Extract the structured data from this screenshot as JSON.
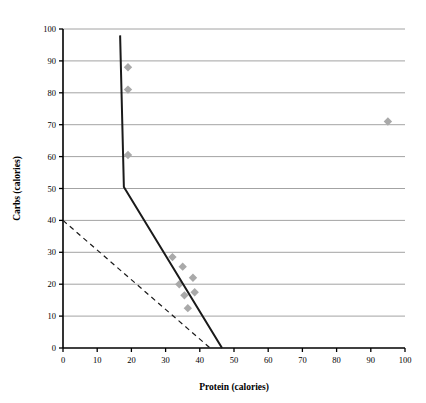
{
  "chart_data": {
    "type": "scatter",
    "title": "",
    "xlabel": "Protein (calories)",
    "ylabel": "Carbs (calories)",
    "xlim": [
      0,
      100
    ],
    "ylim": [
      0,
      100
    ],
    "xticks": [
      0,
      10,
      20,
      30,
      40,
      50,
      60,
      70,
      80,
      90,
      100
    ],
    "yticks": [
      0,
      10,
      20,
      30,
      40,
      50,
      60,
      70,
      80,
      90,
      100
    ],
    "xtick_labels": [
      "0",
      "10",
      "20",
      "30",
      "40",
      "50",
      "60",
      "70",
      "80",
      "90",
      "100"
    ],
    "ytick_labels": [
      "0",
      "10",
      "20",
      "30",
      "40",
      "50",
      "60",
      "70",
      "80",
      "90",
      "100"
    ],
    "grid": "horizontal",
    "legend": "none",
    "colors": {
      "marker": "#a9a9a9",
      "solid_line": "#1a1a1a",
      "dashed_line": "#1a1a1a",
      "gridline": "#8c8c8c",
      "axis": "#000000",
      "background": "#ffffff"
    },
    "series": [
      {
        "name": "observations",
        "type": "scatter",
        "marker": "diamond",
        "marker_color": "#a9a9a9",
        "points": [
          {
            "x": 19,
            "y": 88
          },
          {
            "x": 19,
            "y": 81
          },
          {
            "x": 19,
            "y": 60.5
          },
          {
            "x": 32,
            "y": 28.5
          },
          {
            "x": 35,
            "y": 25.5
          },
          {
            "x": 38,
            "y": 22
          },
          {
            "x": 34,
            "y": 20
          },
          {
            "x": 35.5,
            "y": 16.5
          },
          {
            "x": 38.5,
            "y": 17.5
          },
          {
            "x": 36.5,
            "y": 12.5
          },
          {
            "x": 95,
            "y": 71
          }
        ]
      },
      {
        "name": "solid-boundary",
        "type": "line",
        "style": "solid",
        "color": "#1a1a1a",
        "width": 2,
        "points": [
          {
            "x": 16.7,
            "y": 98
          },
          {
            "x": 17.8,
            "y": 50.5
          },
          {
            "x": 46.5,
            "y": 0
          }
        ]
      },
      {
        "name": "dashed-boundary",
        "type": "line",
        "style": "dashed",
        "color": "#1a1a1a",
        "width": 1.2,
        "points": [
          {
            "x": 0,
            "y": 40
          },
          {
            "x": 43,
            "y": 0
          }
        ]
      }
    ]
  }
}
